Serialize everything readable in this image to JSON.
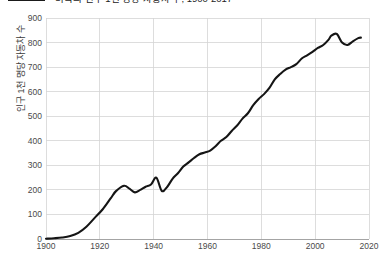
{
  "legend": {
    "label": "미국의 인구 1천 명당 자동차 수, 1900-2017",
    "swatch_name": "series-color-swatch",
    "color": "#151515"
  },
  "axes": {
    "ylabel": "인구 1천 명당 자동차 수",
    "xlabel": "",
    "yticks": [
      "0",
      "100",
      "200",
      "300",
      "400",
      "500",
      "600",
      "700",
      "800",
      "900"
    ],
    "xticks": [
      "1900",
      "1920",
      "1940",
      "1960",
      "1980",
      "2000",
      "2020"
    ]
  },
  "chart_data": {
    "type": "line",
    "title": "",
    "xlabel": "",
    "ylabel": "인구 1천 명당 자동차 수",
    "xlim": [
      1900,
      2020
    ],
    "ylim": [
      0,
      900
    ],
    "grid": true,
    "legend_position": "top-left",
    "series": [
      {
        "name": "인구 1천 명당 자동차 수",
        "color": "#151515",
        "x": [
          1900,
          1903,
          1906,
          1909,
          1912,
          1915,
          1918,
          1921,
          1924,
          1926,
          1929,
          1931,
          1933,
          1935,
          1937,
          1939,
          1941,
          1943,
          1945,
          1947,
          1949,
          1951,
          1953,
          1955,
          1957,
          1959,
          1961,
          1963,
          1965,
          1967,
          1969,
          1971,
          1973,
          1975,
          1977,
          1979,
          1981,
          1983,
          1985,
          1987,
          1989,
          1991,
          1993,
          1995,
          1997,
          1999,
          2001,
          2003,
          2005,
          2006,
          2008,
          2010,
          2012,
          2014,
          2016,
          2017
        ],
        "y": [
          1,
          3,
          6,
          12,
          25,
          50,
          85,
          120,
          165,
          195,
          217,
          205,
          190,
          200,
          213,
          222,
          250,
          196,
          212,
          245,
          268,
          295,
          312,
          330,
          345,
          352,
          360,
          378,
          400,
          415,
          440,
          462,
          490,
          512,
          545,
          570,
          590,
          615,
          650,
          672,
          690,
          700,
          712,
          735,
          748,
          762,
          778,
          790,
          812,
          828,
          835,
          800,
          790,
          805,
          818,
          820
        ]
      }
    ]
  }
}
